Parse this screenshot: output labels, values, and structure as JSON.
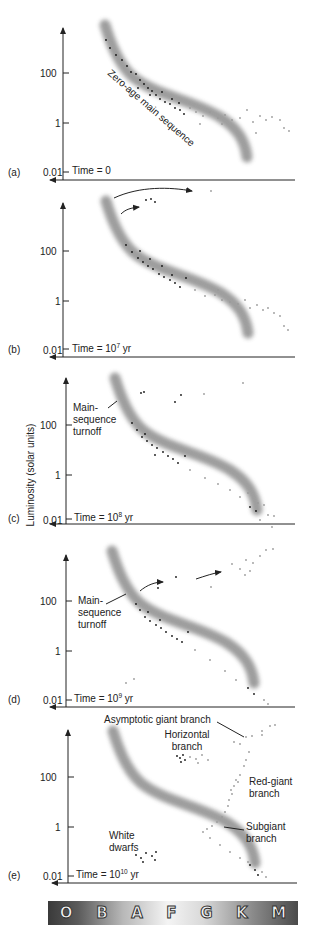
{
  "figure": {
    "y_axis_label": "Luminosity (solar units)",
    "y_ticks": [
      "100",
      "1",
      "0.01"
    ],
    "spectral_classes": [
      "O",
      "B",
      "A",
      "F",
      "G",
      "K",
      "M"
    ],
    "colors": {
      "main_sequence_band": "#8c8c8c",
      "dark_stars": "#111111",
      "light_stars": "#9a9a9a",
      "axis": "#222222"
    }
  },
  "panels": [
    {
      "id": "a",
      "tag": "(a)",
      "time_label": "Time = 0",
      "time_base": "",
      "time_exp": "",
      "time_unit": "",
      "annotations": [
        "Zero-age main sequence"
      ]
    },
    {
      "id": "b",
      "tag": "(b)",
      "time_label": "Time = 10",
      "time_base": "10",
      "time_exp": "7",
      "time_unit": " yr",
      "annotations": []
    },
    {
      "id": "c",
      "tag": "(c)",
      "time_label": "Time = 10",
      "time_base": "10",
      "time_exp": "8",
      "time_unit": " yr",
      "annotations": [
        "Main-",
        "sequence",
        "turnoff"
      ]
    },
    {
      "id": "d",
      "tag": "(d)",
      "time_label": "Time = 10",
      "time_base": "10",
      "time_exp": "9",
      "time_unit": " yr",
      "annotations": [
        "Main-",
        "sequence",
        "turnoff"
      ]
    },
    {
      "id": "e",
      "tag": "(e)",
      "time_label": "Time = 10",
      "time_base": "10",
      "time_exp": "10",
      "time_unit": " yr",
      "annotations": {
        "agb": "Asymptotic giant branch",
        "hb1": "Horizontal",
        "hb2": "branch",
        "rgb1": "Red-giant",
        "rgb2": "branch",
        "sgb1": "Subgiant",
        "sgb2": "branch",
        "wd1": "White",
        "wd2": "dwarfs"
      }
    }
  ]
}
